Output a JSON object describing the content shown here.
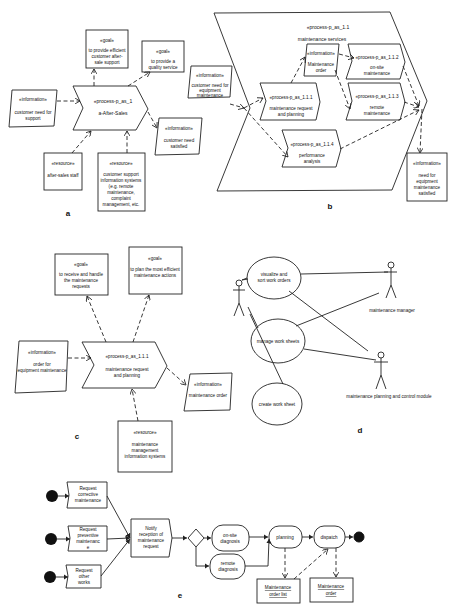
{
  "panels": {
    "a": {
      "label": "a",
      "process": {
        "stereotype": "«process-p_as_1",
        "name": "a-After-Sales"
      },
      "goal1": {
        "stereotype": "«goal»",
        "lines": [
          "to provide efficient",
          "customer after-",
          "sale support"
        ]
      },
      "goal2": {
        "stereotype": "«goal»",
        "lines": [
          "to provide a",
          "quality service"
        ]
      },
      "info_in": {
        "stereotype": "«information»",
        "lines": [
          "customer need for",
          "support"
        ]
      },
      "info_out": {
        "stereotype": "«information»",
        "lines": [
          "customer need",
          "satisfied"
        ]
      },
      "res1": {
        "stereotype": "«resource»",
        "lines": [
          "after-sales staff"
        ]
      },
      "res2": {
        "stereotype": "«resource»",
        "lines": [
          "customer support",
          "information systems",
          "(e.g. remote",
          "maintenance,",
          "complaint",
          "management, etc."
        ]
      }
    },
    "b": {
      "label": "b",
      "container": {
        "stereotype": "«process-p_as_1.1",
        "name": "maintenance services"
      },
      "info_in": {
        "stereotype": "«information»",
        "lines": [
          "customer need for",
          "equipment",
          "maintenance"
        ]
      },
      "p111": {
        "stereotype": "«process-p_as_1.1.1",
        "lines": [
          "maintenance request",
          "and planning"
        ]
      },
      "order": {
        "stereotype": "«information»",
        "lines": [
          "Maintenance",
          "order"
        ]
      },
      "p112": {
        "stereotype": "«process-p_as_1.1.2",
        "lines": [
          "on-site",
          "maintenance"
        ]
      },
      "p113": {
        "stereotype": "«process-p_as_1.1.3",
        "lines": [
          "remote",
          "maintenance"
        ]
      },
      "p114": {
        "stereotype": "«process-p_as_1.1.4",
        "lines": [
          "performance",
          "analysis"
        ]
      },
      "info_out": {
        "stereotype": "«information»",
        "lines": [
          "need for",
          "equipment",
          "maintenance",
          "satisfied"
        ]
      }
    },
    "c": {
      "label": "c",
      "process": {
        "stereotype": "«process-p_as_1.1.1",
        "lines": [
          "maintenance request",
          "and planning"
        ]
      },
      "goal1": {
        "stereotype": "«goal»",
        "lines": [
          "to receive and handle",
          "the maintenance",
          "requests"
        ]
      },
      "goal2": {
        "stereotype": "«goal»",
        "lines": [
          "to plan the most efficient",
          "maintenance actions"
        ]
      },
      "info_in": {
        "stereotype": "«information»",
        "lines": [
          "order for",
          "equipment maintenance"
        ]
      },
      "info_out": {
        "stereotype": "«information»",
        "lines": [
          "maintenance order"
        ]
      },
      "res": {
        "stereotype": "«resource»",
        "lines": [
          "maintenance",
          "management",
          "information systems"
        ]
      }
    },
    "d": {
      "label": "d",
      "usecases": [
        {
          "lines": [
            "visualize and",
            "sort work orders"
          ]
        },
        {
          "lines": [
            "manage work sheets"
          ]
        },
        {
          "lines": [
            "create work sheet"
          ]
        }
      ],
      "actors": [
        {
          "name": ""
        },
        {
          "name": "maintenance manager"
        },
        {
          "name": "maintenance planning and control module"
        }
      ]
    },
    "e": {
      "label": "e",
      "requests": [
        {
          "lines": [
            "Request",
            "corrective",
            "maintenance"
          ]
        },
        {
          "lines": [
            "Request",
            "preventive",
            "maintenanc",
            "e"
          ]
        },
        {
          "lines": [
            "Request",
            "other",
            "works"
          ]
        }
      ],
      "notify": {
        "lines": [
          "Notify",
          "reception of",
          "maintenance",
          "request"
        ]
      },
      "onsite": {
        "lines": [
          "on-site",
          "diagnosis"
        ]
      },
      "remote": {
        "lines": [
          "remote",
          "diagnosis"
        ]
      },
      "planning": {
        "label": "planning"
      },
      "dispatch": {
        "label": "dispatch"
      },
      "order_list": {
        "lines": [
          "Maintenance",
          "order list"
        ]
      },
      "order": {
        "lines": [
          "Maintenance",
          "order"
        ]
      }
    }
  }
}
